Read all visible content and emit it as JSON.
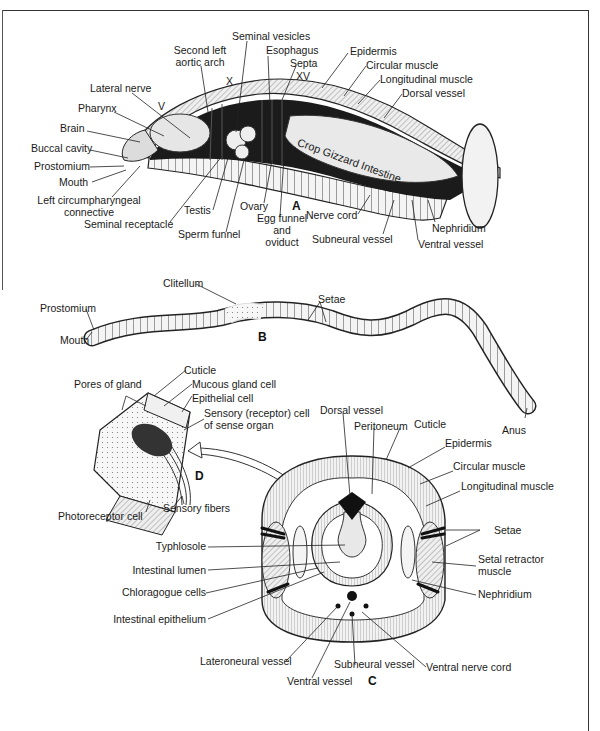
{
  "figure": {
    "panels": {
      "A": {
        "letter": "A",
        "title": "Longitudinal dissection of anterior earthworm",
        "segment_markers": [
          "V",
          "X",
          "XV"
        ],
        "labels": {
          "seminal_vesicles": "Seminal vesicles",
          "second_left_aortic_arch_1": "Second left",
          "second_left_aortic_arch_2": "aortic arch",
          "esophagus": "Esophagus",
          "septa": "Septa",
          "lateral_nerve": "Lateral nerve",
          "pharynx": "Pharynx",
          "brain": "Brain",
          "buccal_cavity": "Buccal cavity",
          "prostomium": "Prostomium",
          "mouth": "Mouth",
          "left_circumpharyngeal_1": "Left circumpharyngeal",
          "left_circumpharyngeal_2": "connective",
          "seminal_receptacle": "Seminal receptacle",
          "testis": "Testis",
          "sperm_funnel": "Sperm funnel",
          "ovary": "Ovary",
          "egg_funnel_1": "Egg funnel",
          "egg_funnel_2": "and",
          "egg_funnel_3": "oviduct",
          "nerve_cord": "Nerve cord",
          "subneural_vessel": "Subneural vessel",
          "ventral_vessel": "Ventral vessel",
          "nephridium": "Nephridium",
          "epidermis": "Epidermis",
          "circular_muscle": "Circular muscle",
          "longitudinal_muscle": "Longitudinal muscle",
          "dorsal_vessel": "Dorsal vessel",
          "gut_regions": "Crop Gizzard Intestine"
        }
      },
      "B": {
        "letter": "B",
        "labels": {
          "clitellum": "Clitellum",
          "prostomium": "Prostomium",
          "mouth": "Mouth",
          "setae": "Setae",
          "anus": "Anus"
        }
      },
      "C": {
        "letter": "C",
        "labels": {
          "dorsal_vessel": "Dorsal vessel",
          "peritoneum": "Peritoneum",
          "cuticle": "Cuticle",
          "epidermis": "Epidermis",
          "circular_muscle": "Circular muscle",
          "longitudinal_muscle": "Longitudinal muscle",
          "setae": "Setae",
          "setal_retractor_1": "Setal retractor",
          "setal_retractor_2": "muscle",
          "nephridium": "Nephridium",
          "typhlosole": "Typhlosole",
          "intestinal_lumen": "Intestinal lumen",
          "chloragogue_cells": "Chloragogue cells",
          "intestinal_epithelium": "Intestinal epithelium",
          "lateroneural_vessel": "Lateroneural vessel",
          "ventral_vessel": "Ventral vessel",
          "subneural_vessel": "Subneural vessel",
          "ventral_nerve_cord": "Ventral nerve cord"
        }
      },
      "D": {
        "letter": "D",
        "labels": {
          "cuticle": "Cuticle",
          "pores_of_gland": "Pores of gland",
          "mucous_gland_cell": "Mucous gland cell",
          "epithelial_cell": "Epithelial cell",
          "sensory_cell_1": "Sensory (receptor) cell",
          "sensory_cell_2": "of sense organ",
          "sensory_fibers": "Sensory fibers",
          "photoreceptor_cell": "Photoreceptor cell"
        }
      }
    },
    "colors": {
      "ink": "#1a1a1a",
      "background": "#ffffff",
      "shade": "#d9d9d9",
      "dark": "#111111"
    }
  }
}
